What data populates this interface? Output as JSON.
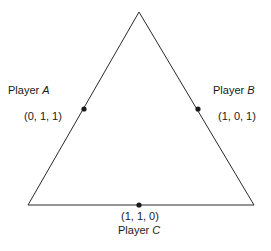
{
  "diagram": {
    "type": "triangle",
    "vertices": [
      [
        139,
        12
      ],
      [
        28,
        205
      ],
      [
        254,
        205
      ]
    ],
    "stroke_color": "#2a2a2a",
    "points": [
      {
        "id": "A",
        "player_label": "Player",
        "player_letter": "A",
        "coords": "(0, 1, 1)",
        "x": 84,
        "y": 109
      },
      {
        "id": "B",
        "player_label": "Player",
        "player_letter": "B",
        "coords": "(1, 0, 1)",
        "x": 198,
        "y": 109
      },
      {
        "id": "C",
        "player_label": "Player",
        "player_letter": "C",
        "coords": "(1, 1, 0)",
        "x": 139,
        "y": 205
      }
    ]
  }
}
